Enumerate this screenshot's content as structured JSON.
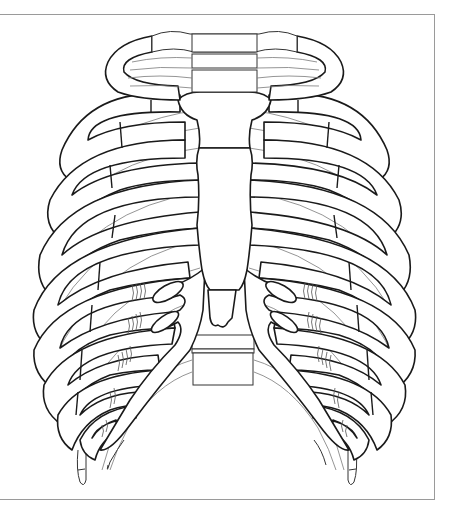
{
  "figure": {
    "style": "black line art on white",
    "colors": {
      "background": "#ffffff",
      "outline": "#1a1a1a",
      "posterior_lines": "#7a7a7a",
      "frame": "#9a9a9a"
    },
    "frame": {
      "top_y": 14,
      "bottom_y": 500,
      "right_x": 435,
      "left_border": false
    },
    "parts": [
      "first-rib-ring",
      "manubrium",
      "sternum-body",
      "xiphoid-process",
      "costal-cartilages",
      "true-ribs",
      "false-ribs",
      "floating-ribs",
      "thoracic-vertebrae",
      "lumbar-vertebrae"
    ],
    "rib_pairs": 12
  }
}
